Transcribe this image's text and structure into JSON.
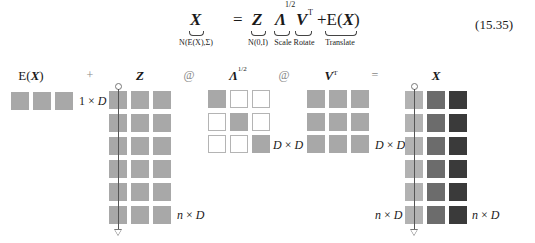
{
  "equation": {
    "number": "(15.35)",
    "lhs": {
      "symbol": "X",
      "under": "N(E(X),Σ)"
    },
    "equals": "=",
    "terms": [
      {
        "symbol": "Z",
        "under": "N(0,I)"
      },
      {
        "symbol": "Λ",
        "sup": "1/2",
        "under": "Scale"
      },
      {
        "symbol": "V",
        "sup": "T",
        "under": "Rotate"
      },
      {
        "prefix": "+E(",
        "symbol": "X",
        "suffix": ")",
        "under": "Translate"
      }
    ]
  },
  "diagram": {
    "labels": {
      "ex": {
        "pre": "E(",
        "sym": "X",
        "post": ")"
      },
      "z": "Z",
      "lambda": "Λ",
      "lambda_sup": "1/2",
      "vt": "V",
      "vt_sup": "T",
      "x": "X"
    },
    "operators": {
      "plus": "+",
      "at1": "@",
      "at2": "@",
      "eq": "="
    },
    "dims": {
      "ex": {
        "a": "1",
        "x": "×",
        "b": "D"
      },
      "z": {
        "a": "n",
        "x": "×",
        "b": "D"
      },
      "lambda": {
        "a": "D",
        "x": "×",
        "b": "D"
      },
      "vt": {
        "a": "D",
        "x": "×",
        "b": "D"
      },
      "x": {
        "a": "n",
        "x": "×",
        "b": "D"
      }
    },
    "matrices": {
      "ex": {
        "rows": 1,
        "cols": 3
      },
      "z": {
        "rows": 6,
        "cols": 3
      },
      "lambda": {
        "rows": 3,
        "cols": 3,
        "diagonal": true
      },
      "vt": {
        "rows": 3,
        "cols": 3
      },
      "x": {
        "rows": 6,
        "cols": 3,
        "column_shades": [
          "light",
          "medium",
          "dark"
        ]
      }
    },
    "colors": {
      "gray": "#a8a8a8",
      "light": "#b2b2b2",
      "medium": "#6c6c6c",
      "dark": "#3a3a3a"
    }
  }
}
